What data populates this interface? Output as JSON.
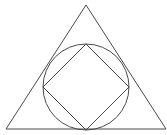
{
  "diagram": {
    "stroke_color": "#4a4a4a",
    "background": "#ffffff",
    "triangle": {
      "points": [
        [
          86,
          5
        ],
        [
          6,
          129
        ],
        [
          166,
          129
        ]
      ]
    },
    "circle": {
      "cx": 86,
      "cy": 87,
      "r": 43
    },
    "square": {
      "points": [
        [
          86,
          44
        ],
        [
          129,
          87
        ],
        [
          86,
          130
        ],
        [
          43,
          87
        ]
      ]
    }
  }
}
